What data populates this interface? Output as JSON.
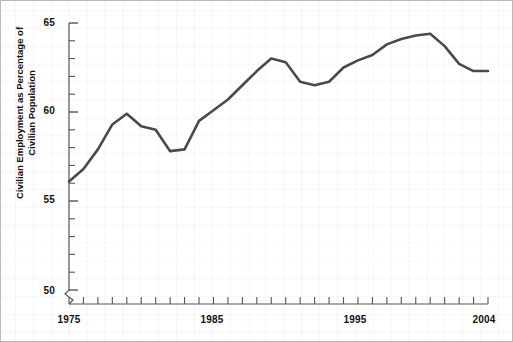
{
  "chart_data": {
    "type": "line",
    "title": "",
    "subtitle": "",
    "xlabel": "",
    "ylabel": "Civilian Employment as Percentage of Civilian Population",
    "xlim": [
      1975,
      2004
    ],
    "ylim": [
      50,
      65
    ],
    "y_ticks": [
      50,
      55,
      60,
      65
    ],
    "y_tick_labels": [
      "50",
      "55",
      "60",
      "65"
    ],
    "y_minor_tick_step": 1,
    "x_ticks": [
      1975,
      1985,
      1995,
      2004
    ],
    "x_tick_labels": [
      "1975",
      "1985",
      "1995",
      "2004"
    ],
    "x_minor_tick_step": 1,
    "grid": true,
    "grid_color": "#eeeeee",
    "legend": null,
    "y_axis_break": true,
    "x_axis_break": true,
    "line_color": "#4a4a4a",
    "line_width": 2.6,
    "x": [
      1975,
      1976,
      1977,
      1978,
      1979,
      1980,
      1981,
      1982,
      1983,
      1984,
      1985,
      1986,
      1987,
      1988,
      1989,
      1990,
      1991,
      1992,
      1993,
      1994,
      1995,
      1996,
      1997,
      1998,
      1999,
      2000,
      2001,
      2002,
      2003,
      2004
    ],
    "values": [
      56.1,
      56.8,
      57.9,
      59.3,
      59.9,
      59.2,
      59.0,
      57.8,
      57.9,
      59.5,
      60.1,
      60.7,
      61.5,
      62.3,
      63.0,
      62.8,
      61.7,
      61.5,
      61.7,
      62.5,
      62.9,
      63.2,
      63.8,
      64.1,
      64.3,
      64.4,
      63.7,
      62.7,
      62.3,
      62.3
    ],
    "interpolation": "linear"
  },
  "axis": {
    "y_labels": [
      "65",
      "60",
      "55",
      "50"
    ],
    "x_labels": [
      "1975",
      "1985",
      "1995",
      "2004"
    ],
    "y_title": "Civilian Employment as Percentage of Civilian Population"
  }
}
